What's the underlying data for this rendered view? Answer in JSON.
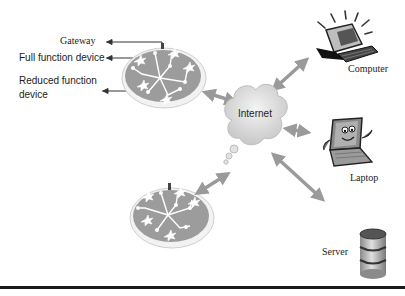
{
  "diagram": {
    "type": "network-topology",
    "legend": {
      "gateway": "Gateway",
      "full_function_device": "Full function device",
      "reduced_function_device_line1": "Reduced function",
      "reduced_function_device_line2": "device"
    },
    "center_node": {
      "label": "Internet",
      "icon": "cloud-icon"
    },
    "devices": [
      {
        "label": "Computer",
        "icon": "desktop-computer-icon"
      },
      {
        "label": "Laptop",
        "icon": "laptop-icon"
      },
      {
        "label": "Server",
        "icon": "database-server-icon"
      }
    ],
    "networks": [
      {
        "name": "sensor-network-top",
        "icon": "mesh-network-disc-icon"
      },
      {
        "name": "sensor-network-bottom",
        "icon": "mesh-network-disc-icon"
      }
    ],
    "colors": {
      "arrow": "#9a9a9a",
      "disc": "#9c9c9c",
      "cloud": "#dcdcdc",
      "rule": "#1a1a1a"
    }
  }
}
